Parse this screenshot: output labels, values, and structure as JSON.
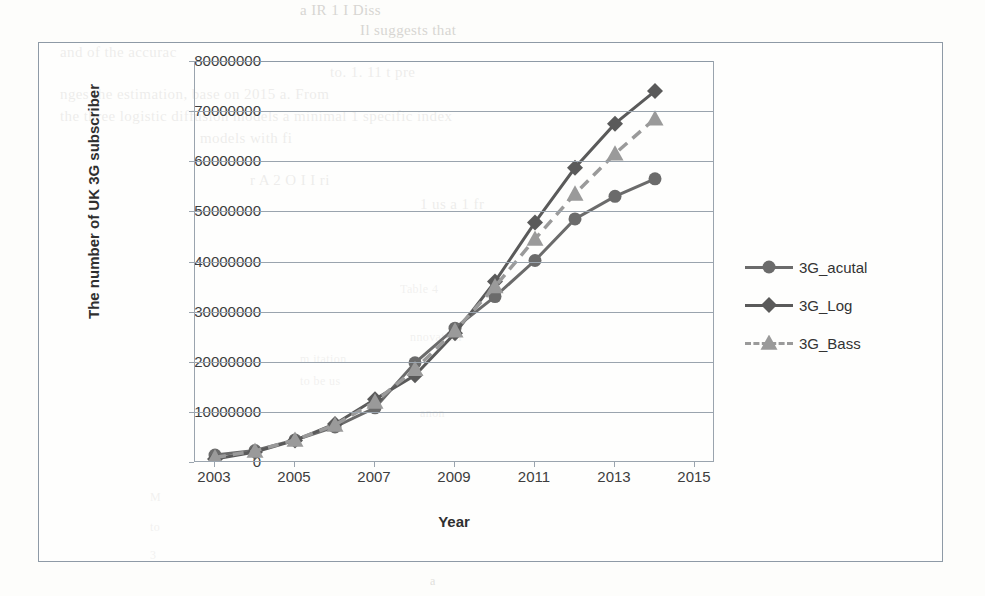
{
  "chart_data": {
    "type": "line",
    "title": "",
    "xlabel": "Year",
    "ylabel": "The number of UK 3G subscriber",
    "x": [
      2003,
      2004,
      2005,
      2006,
      2007,
      2008,
      2009,
      2010,
      2011,
      2012,
      2013,
      2014
    ],
    "xlim": [
      2002.5,
      2015.5
    ],
    "ylim": [
      0,
      80000000
    ],
    "grid": true,
    "legend_position": "right",
    "x_tick_labels": [
      "2003",
      "2005",
      "2007",
      "2009",
      "2011",
      "2013",
      "2015"
    ],
    "x_tick_values": [
      2003,
      2005,
      2007,
      2009,
      2011,
      2013,
      2015
    ],
    "y_tick_labels": [
      "0",
      "10000000",
      "20000000",
      "30000000",
      "40000000",
      "50000000",
      "60000000",
      "70000000",
      "80000000"
    ],
    "y_tick_values": [
      0,
      10000000,
      20000000,
      30000000,
      40000000,
      50000000,
      60000000,
      70000000,
      80000000
    ],
    "series": [
      {
        "name": "3G_acutal",
        "marker": "circle",
        "line_style": "solid",
        "color": "#6b6b6b",
        "values": [
          1400000,
          2300000,
          4400000,
          7000000,
          10800000,
          19800000,
          26700000,
          33000000,
          40200000,
          48500000,
          53000000,
          56500000
        ]
      },
      {
        "name": "3G_Log",
        "marker": "diamond",
        "line_style": "solid",
        "color": "#5a5a5a",
        "values": [
          600000,
          2000000,
          4300000,
          7600000,
          12500000,
          17300000,
          25700000,
          36000000,
          47800000,
          58700000,
          67500000,
          74000000
        ]
      },
      {
        "name": "3G_Bass",
        "marker": "triangle",
        "line_style": "dashed",
        "color": "#9a9a9a",
        "values": [
          900000,
          2200000,
          4400000,
          7400000,
          12000000,
          18500000,
          26200000,
          35000000,
          44500000,
          53500000,
          61500000,
          68500000
        ]
      }
    ]
  },
  "legend": {
    "items": [
      {
        "label": "3G_acutal"
      },
      {
        "label": "3G_Log"
      },
      {
        "label": "3G_Bass"
      }
    ]
  },
  "background_text": {
    "lines": [
      "a IR 1 I Diss",
      "Il suggests that",
      "models with fi",
      "and of the accurac",
      "to. 1. 11 t pre",
      "the adoption",
      "Table 4",
      "a",
      "nnovation",
      "m itation",
      "anon",
      "M",
      "to be us",
      "to",
      "3",
      "nges the estimation, base on 2015 a. From",
      "the three logistic diffusion models a minimal 1 specific index",
      "r A 2 O I I ri",
      "1 us a 1 fr"
    ]
  }
}
